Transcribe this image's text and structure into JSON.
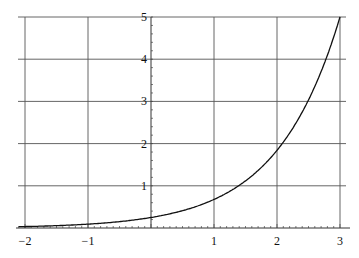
{
  "chart_data": {
    "type": "line",
    "title": "",
    "xlabel": "",
    "ylabel": "",
    "xlim": [
      -2.1,
      3.05
    ],
    "ylim": [
      0,
      5
    ],
    "grid": true,
    "legend": null,
    "x_ticks": [
      -2,
      -1,
      1,
      2,
      3
    ],
    "y_ticks": [
      1,
      2,
      3,
      4,
      5
    ],
    "x_tick_labels": [
      "−2",
      "−1",
      "1",
      "2",
      "3"
    ],
    "y_tick_labels": [
      "1",
      "2",
      "3",
      "4",
      "5"
    ],
    "series": [
      {
        "name": "exponential curve",
        "function_approx": "y = e^(x - 1.39)",
        "x": [
          -2.1,
          -2,
          -1.5,
          -1,
          -0.5,
          0,
          0.5,
          1,
          1.5,
          2,
          2.5,
          3
        ],
        "y": [
          0.03,
          0.03,
          0.05,
          0.09,
          0.15,
          0.25,
          0.41,
          0.68,
          1.12,
          1.84,
          3.03,
          5.0
        ]
      }
    ]
  }
}
